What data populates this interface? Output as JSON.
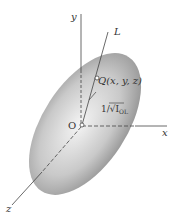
{
  "diagram": {
    "labels": {
      "y_axis": "y",
      "x_axis": "x",
      "z_axis": "z",
      "line": "L",
      "point": "Q(x, y, z)",
      "origin": "O",
      "distance": "1/√I",
      "distance_sub": "OL"
    },
    "colors": {
      "ellipsoid_light": "#f2f2f2",
      "ellipsoid_dark": "#8a8a8a",
      "axis": "#444444"
    }
  }
}
